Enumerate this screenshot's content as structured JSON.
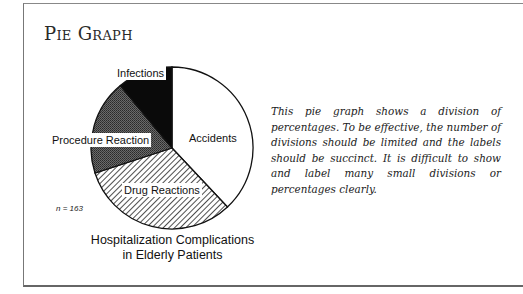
{
  "section_title": "Pie Graph",
  "chart_data": {
    "type": "pie",
    "title": "Hospitalization Complications in Elderly Patients",
    "title_lines": [
      "Hospitalization Complications",
      "in Elderly Patients"
    ],
    "annotation": "n = 163",
    "slices": [
      {
        "label": "Accidents",
        "value": 38,
        "fill": "white"
      },
      {
        "label": "Drug Reactions",
        "value": 32,
        "fill": "diagonal-hatch"
      },
      {
        "label": "Procedure Reaction",
        "value": 19,
        "fill": "dark-gray-dots"
      },
      {
        "label": "Infections",
        "value": 11,
        "fill": "black"
      }
    ],
    "start_angle_deg": 0,
    "direction": "clockwise",
    "legend": "none (direct labels)"
  },
  "labels": {
    "accidents": "Accidents",
    "drug": "Drug Reactions",
    "procedure": "Procedure Reaction",
    "infections": "Infections"
  },
  "description": "This pie graph shows a division of percentages. To be effective, the number of divisions should be limited and the labels should be succinct. It is difficult to show and label many small divisions or percentages clearly.",
  "colors": {
    "infections": "#0a0a0a",
    "procedure": "#555555",
    "outline": "#111111"
  }
}
